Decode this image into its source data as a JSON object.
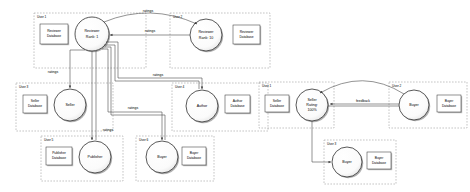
{
  "diagram": {
    "style": {
      "background": "#ffffff",
      "stroke": "#4a4a4a",
      "node_fill": "#ffffff",
      "shadow": "#9a9a9a",
      "group_border": "#8a8a8a",
      "text": "#000000"
    },
    "group_label_prefix": "User"
  },
  "left_panel": {
    "groups": [
      {
        "id": "g1",
        "label": "User 1",
        "x": 34,
        "y": 13,
        "w": 112,
        "h": 55,
        "database": {
          "name": "Reviewer Database",
          "lines": [
            "Reviewer",
            "Database"
          ],
          "x": 40,
          "y": 24,
          "w": 28,
          "h": 20
        },
        "node": {
          "name": "Reviewer Rank 1",
          "lines": [
            "Reviewer",
            "Rank: 1"
          ],
          "cx": 92,
          "cy": 34,
          "r": 17
        }
      },
      {
        "id": "g2",
        "label": "User 2",
        "x": 170,
        "y": 13,
        "w": 100,
        "h": 55,
        "database": {
          "name": "Reviewer Database",
          "lines": [
            "Reviewer",
            "Database"
          ],
          "x": 233,
          "y": 25,
          "w": 27,
          "h": 19
        },
        "node": {
          "name": "Reviewer Rank 10",
          "lines": [
            "Reviewer",
            "Rank: 10"
          ],
          "cx": 206,
          "cy": 35,
          "r": 16
        }
      },
      {
        "id": "g3",
        "label": "User 3",
        "x": 16,
        "y": 83,
        "w": 97,
        "h": 48,
        "database": {
          "name": "Seller Database",
          "lines": [
            "Seller",
            "Database"
          ],
          "x": 23,
          "y": 95,
          "w": 24,
          "h": 18
        },
        "node": {
          "name": "Seller",
          "lines": [
            "Seller"
          ],
          "cx": 70,
          "cy": 105,
          "r": 16
        }
      },
      {
        "id": "g4",
        "label": "User 4",
        "x": 172,
        "y": 83,
        "w": 96,
        "h": 48,
        "database": {
          "name": "Author Database",
          "lines": [
            "Author",
            "Database"
          ],
          "x": 225,
          "y": 95,
          "w": 25,
          "h": 18
        },
        "node": {
          "name": "Author",
          "lines": [
            "Author"
          ],
          "cx": 202,
          "cy": 106,
          "r": 16
        }
      },
      {
        "id": "g5",
        "label": "User 5",
        "x": 41,
        "y": 136,
        "w": 82,
        "h": 45,
        "database": {
          "name": "Publisher Database",
          "lines": [
            "Publisher",
            "Database"
          ],
          "x": 46,
          "y": 147,
          "w": 26,
          "h": 18
        },
        "node": {
          "name": "Publisher",
          "lines": [
            "Publisher"
          ],
          "cx": 95,
          "cy": 157,
          "r": 16
        }
      },
      {
        "id": "g6",
        "label": "User 6",
        "x": 136,
        "y": 136,
        "w": 78,
        "h": 45,
        "database": {
          "name": "Buyer Database",
          "lines": [
            "Buyer",
            "Database"
          ],
          "x": 182,
          "y": 147,
          "w": 24,
          "h": 18
        },
        "node": {
          "name": "Buyer",
          "lines": [
            "Buyer"
          ],
          "cx": 162,
          "cy": 157,
          "r": 16
        }
      }
    ],
    "edges": [
      {
        "from": "Reviewer Rank 1",
        "to": "Reviewer Rank 10",
        "label": "ratings",
        "lx": 148,
        "ly": 11
      },
      {
        "from": "Reviewer Rank 10",
        "to": "Reviewer Rank 1",
        "label": "ratings",
        "lx": 150,
        "ly": 32
      },
      {
        "from": "Reviewer Rank 1",
        "to": "Seller",
        "label": "ratings",
        "lx": 53,
        "ly": 72
      },
      {
        "from": "Reviewer Rank 1",
        "to": "Author",
        "label": "ratings",
        "lx": 158,
        "ly": 79
      },
      {
        "from": "Reviewer Rank 1",
        "to": "Publisher",
        "label": "ratings",
        "lx": 106,
        "ly": 130
      },
      {
        "from": "Reviewer Rank 1",
        "to": "Buyer",
        "label": "ratings",
        "lx": 133,
        "ly": 107
      }
    ]
  },
  "right_panel": {
    "groups": [
      {
        "id": "r1",
        "label": "User 1",
        "x": 259,
        "y": 82,
        "w": 75,
        "h": 46,
        "database": {
          "name": "Seller Database",
          "lines": [
            "Seller",
            "Database"
          ],
          "x": 265,
          "y": 95,
          "w": 24,
          "h": 17
        },
        "node": {
          "name": "Seller Rating 100%",
          "lines": [
            "Seller",
            "Rating:",
            "100%"
          ],
          "cx": 312,
          "cy": 105,
          "r": 16
        }
      },
      {
        "id": "r2",
        "label": "User 2",
        "x": 389,
        "y": 82,
        "w": 78,
        "h": 46,
        "database": {
          "name": "Buyer Database",
          "lines": [
            "Buyer",
            "Database"
          ],
          "x": 437,
          "y": 95,
          "w": 24,
          "h": 17
        },
        "node": {
          "name": "Buyer",
          "lines": [
            "Buyer"
          ],
          "cx": 414,
          "cy": 105,
          "r": 15
        }
      },
      {
        "id": "r3",
        "label": "User 3",
        "x": 324,
        "y": 140,
        "w": 72,
        "h": 44,
        "database": {
          "name": "Buyer Database",
          "lines": [
            "Buyer",
            "Database"
          ],
          "x": 367,
          "y": 152,
          "w": 24,
          "h": 17
        },
        "node": {
          "name": "Buyer",
          "lines": [
            "Buyer"
          ],
          "cx": 347,
          "cy": 162,
          "r": 15
        }
      }
    ],
    "edges": [
      {
        "from": "Seller Rating 100%",
        "to": "Buyer",
        "label": "feedback",
        "lx": 363,
        "ly": 102
      },
      {
        "from": "Buyer",
        "to": "Seller Rating 100%",
        "label": "",
        "lx": 0,
        "ly": 0
      },
      {
        "from": "Seller Rating 100%",
        "to": "Buyer",
        "label": "",
        "lx": 0,
        "ly": 0
      }
    ]
  }
}
